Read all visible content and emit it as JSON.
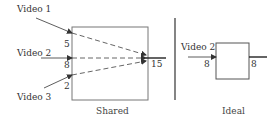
{
  "colors": {
    "stroke": "#666666",
    "dark": "#222222",
    "text": "#333333",
    "divider": "#333333"
  },
  "shared": {
    "caption": "Shared",
    "inputs": [
      {
        "label": "Video 1",
        "value": "5"
      },
      {
        "label": "Video 2",
        "value": "8"
      },
      {
        "label": "Video 3",
        "value": "2"
      }
    ],
    "output_value": "15"
  },
  "ideal": {
    "caption": "Ideal",
    "input_label": "Video 2",
    "input_value": "8",
    "output_value": "8"
  }
}
